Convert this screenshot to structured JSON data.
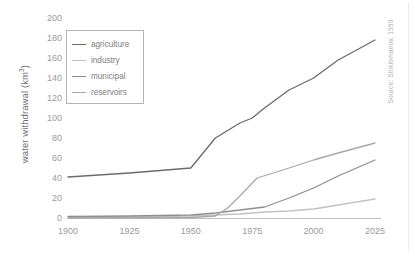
{
  "chart_data": {
    "type": "line",
    "title": "",
    "xlabel": "",
    "ylabel": "water withdrawal (km³)",
    "ylabel_text": "water withdrawal (km",
    "ylabel_sup": "3",
    "ylabel_tail": ")",
    "xlim": [
      1900,
      2025
    ],
    "ylim": [
      0,
      200
    ],
    "grid": false,
    "legend_position": "top-left",
    "xticks": [
      1900,
      1925,
      1950,
      1975,
      2000,
      2025
    ],
    "xtick_labels": [
      "1900",
      "1925",
      "1950",
      "1975",
      "2000",
      "2025"
    ],
    "yticks": [
      0,
      20,
      40,
      60,
      80,
      100,
      120,
      140,
      160,
      180,
      200
    ],
    "ytick_labels": [
      "0",
      "20",
      "40",
      "60",
      "80",
      "100",
      "120",
      "140",
      "160",
      "180",
      "200"
    ],
    "annotation": "Source: Shiklomanov, 1999",
    "series": [
      {
        "name": "agriculture",
        "color": "#6b6b6b",
        "x": [
          1900,
          1925,
          1940,
          1950,
          1960,
          1970,
          1975,
          1980,
          1990,
          2000,
          2010,
          2025
        ],
        "values": [
          41,
          45,
          48,
          50,
          80,
          95,
          100,
          110,
          128,
          140,
          158,
          178
        ]
      },
      {
        "name": "industry",
        "color": "#c2c2c2",
        "x": [
          1900,
          1925,
          1950,
          1960,
          1970,
          1975,
          1980,
          1990,
          2000,
          2010,
          2025
        ],
        "values": [
          0.5,
          1,
          2,
          3,
          4,
          5,
          6,
          7,
          9,
          13,
          19
        ]
      },
      {
        "name": "municipal",
        "color": "#8f8f8f",
        "x": [
          1900,
          1925,
          1950,
          1960,
          1970,
          1980,
          1990,
          2000,
          2010,
          2025
        ],
        "values": [
          1.5,
          2,
          3,
          5,
          8,
          11,
          20,
          30,
          42,
          58
        ]
      },
      {
        "name": "reservoirs",
        "color": "#a8a8a8",
        "x": [
          1900,
          1950,
          1960,
          1965,
          1970,
          1977,
          1985,
          2000,
          2010,
          2025
        ],
        "values": [
          0,
          0.5,
          2,
          10,
          22,
          40,
          46,
          58,
          65,
          75
        ]
      }
    ]
  },
  "legend": {
    "items": [
      {
        "label": "agriculture",
        "color": "#6b6b6b"
      },
      {
        "label": "industry",
        "color": "#c2c2c2"
      },
      {
        "label": "municipal",
        "color": "#8f8f8f"
      },
      {
        "label": "reservoirs",
        "color": "#a8a8a8"
      }
    ]
  },
  "axis": {
    "axis_line_color": "#b9b9b9",
    "tick_label_color": "#9a9a9a"
  }
}
